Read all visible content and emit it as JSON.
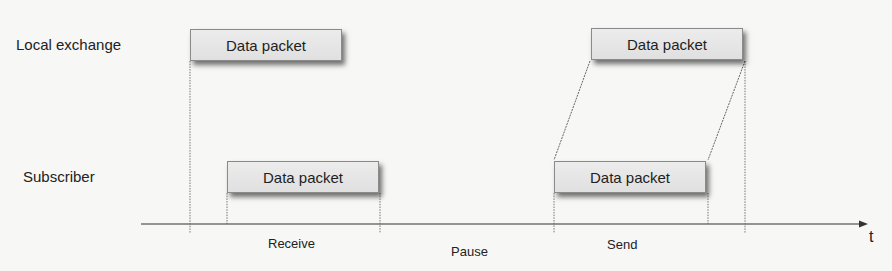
{
  "diagram": {
    "lanes": [
      {
        "id": "local-exchange",
        "label": "Local exchange"
      },
      {
        "id": "subscriber",
        "label": "Subscriber"
      }
    ],
    "packets": [
      {
        "lane": "local-exchange",
        "label": "Data packet",
        "phase": "receive"
      },
      {
        "lane": "subscriber",
        "label": "Data packet",
        "phase": "receive"
      },
      {
        "lane": "local-exchange",
        "label": "Data packet",
        "phase": "send"
      },
      {
        "lane": "subscriber",
        "label": "Data packet",
        "phase": "send"
      }
    ],
    "axis": {
      "label": "t"
    },
    "phases": [
      {
        "id": "receive",
        "label": "Receive"
      },
      {
        "id": "pause",
        "label": "Pause"
      },
      {
        "id": "send",
        "label": "Send"
      }
    ],
    "colors": {
      "background": "#f7f7f6",
      "packet_fill": "#e6e6e6",
      "packet_border": "#8a8a8a",
      "line": "#444444"
    }
  }
}
